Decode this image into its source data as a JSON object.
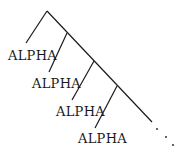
{
  "diagram": {
    "type": "right-branching-tree",
    "root": "apex",
    "labels": [
      "ALPHA",
      "ALPHA",
      "ALPHA",
      "ALPHA"
    ],
    "continuation": "...",
    "line_color": "#1a1a1a"
  }
}
